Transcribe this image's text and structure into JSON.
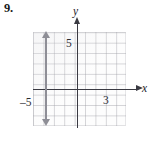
{
  "exercise": {
    "number_label": "9."
  },
  "figure": {
    "axis_labels": {
      "x": "x",
      "y": "y"
    },
    "tick_labels": {
      "y_positive_five": "5",
      "x_positive_three": "3",
      "x_negative_five": "–5"
    },
    "colors": {
      "axis": "#3a3a42",
      "grid": "#969 69e",
      "plotted_line": "#8e8e96",
      "paper": "#ffffff"
    }
  },
  "chart_data": {
    "type": "line",
    "title": "",
    "xlabel": "x",
    "ylabel": "y",
    "xlim": [
      -6,
      3
    ],
    "ylim": [
      -4,
      5
    ],
    "grid": true,
    "legend": "none",
    "tick_labels": {
      "x": [
        "-5",
        "3"
      ],
      "y": [
        "5"
      ]
    },
    "annotations": [
      "Vertical double-headed arrow drawn at x = -3, spanning the full height of the grid",
      "y-axis drawn with arrowhead pointing up, labeled y",
      "x-axis drawn with arrowhead pointing right, labeled x"
    ],
    "series": [
      {
        "name": "x = -3",
        "kind": "vertical-line",
        "x": -3,
        "y_from": -4,
        "y_to": 5,
        "color": "#8e8e96",
        "arrows": "both"
      }
    ]
  }
}
